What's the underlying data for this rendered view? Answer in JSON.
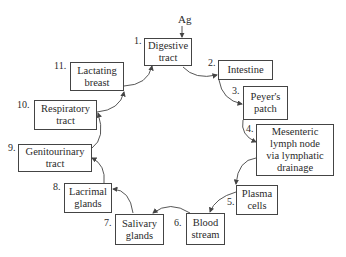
{
  "diagram": {
    "input_label": "Ag",
    "nodes": [
      {
        "num": "1.",
        "label": "Digestive\ntract"
      },
      {
        "num": "2.",
        "label": "Intestine"
      },
      {
        "num": "3.",
        "label": "Peyer's\npatch"
      },
      {
        "num": "4.",
        "label": "Mesenteric\nlymph node\nvia lymphatic\ndrainage"
      },
      {
        "num": "5.",
        "label": "Plasma\ncells"
      },
      {
        "num": "6.",
        "label": "Blood\nstream"
      },
      {
        "num": "7.",
        "label": "Salivary\nglands"
      },
      {
        "num": "8.",
        "label": "Lacrimal\nglands"
      },
      {
        "num": "9.",
        "label": "Genitourinary\ntract"
      },
      {
        "num": "10.",
        "label": "Respiratory\ntract"
      },
      {
        "num": "11.",
        "label": "Lactating\nbreast"
      }
    ],
    "edges": [
      {
        "from": "Ag",
        "to": "1"
      },
      {
        "from": "1",
        "to": "2"
      },
      {
        "from": "2",
        "to": "3"
      },
      {
        "from": "3",
        "to": "4"
      },
      {
        "from": "4",
        "to": "5"
      },
      {
        "from": "5",
        "to": "6"
      },
      {
        "from": "6",
        "to": "7"
      },
      {
        "from": "7",
        "to": "8"
      },
      {
        "from": "8",
        "to": "9"
      },
      {
        "from": "9",
        "to": "10"
      },
      {
        "from": "10",
        "to": "11"
      },
      {
        "from": "11",
        "to": "1"
      }
    ],
    "colors": {
      "line": "#444444",
      "text": "#2a2a2a",
      "background": "#ffffff"
    }
  }
}
